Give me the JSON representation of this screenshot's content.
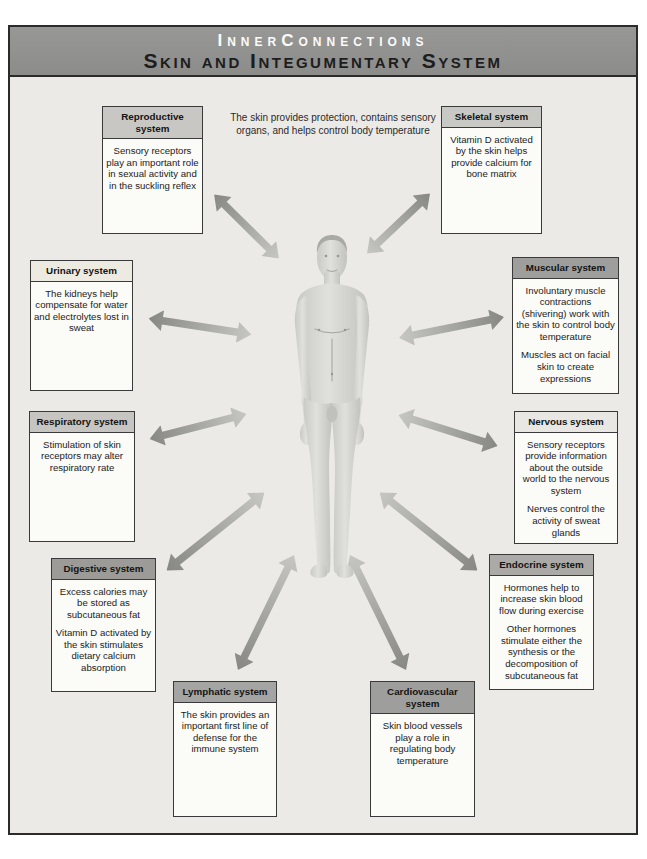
{
  "header": {
    "title": "InnerConnections",
    "subtitle": "Skin and Integumentary System"
  },
  "caption": "The skin provides protection, contains sensory organs, and helps control body temperature",
  "figure": {
    "icon": "male-anatomical-figure"
  },
  "colors": {
    "band_background": "#8f8f8d",
    "band_title": "#fbfbf9",
    "band_subtitle": "#1d1d1d",
    "content_background": "#eceae6",
    "box_background": "#fbfbf8",
    "box_border": "#3a3a3a",
    "arrow_dark": "#878783",
    "arrow_light": "#c6c6c2"
  },
  "systems": [
    {
      "name": "Reproductive system",
      "header_color": "#c8c7c3",
      "notes": [
        "Sensory receptors play an important role in sexual activity and in the suckling reflex"
      ]
    },
    {
      "name": "Skeletal system",
      "header_color": "#c8c9c4",
      "notes": [
        "Vitamin D activated by the skin helps provide calcium for bone matrix"
      ]
    },
    {
      "name": "Urinary system",
      "header_color": "#edebe1",
      "notes": [
        "The kidneys help compensate for water and electrolytes lost in sweat"
      ]
    },
    {
      "name": "Muscular system",
      "header_color": "#9e9e9c",
      "notes": [
        "Involuntary muscle contractions (shivering) work with the skin to control body temperature",
        "Muscles act on facial skin to create expressions"
      ]
    },
    {
      "name": "Respiratory system",
      "header_color": "#c7c5c1",
      "notes": [
        "Stimulation of skin receptors may alter respiratory rate"
      ]
    },
    {
      "name": "Nervous system",
      "header_color": "#e8e7e3",
      "notes": [
        "Sensory receptors provide information about the outside world to the nervous system",
        "Nerves control the activity of sweat glands"
      ]
    },
    {
      "name": "Digestive system",
      "header_color": "#9c9b97",
      "notes": [
        "Excess calories may be stored as subcutaneous fat",
        "Vitamin D activated by the skin stimulates dietary calcium absorption"
      ]
    },
    {
      "name": "Endocrine system",
      "header_color": "#abaaa6",
      "notes": [
        "Hormones help to increase skin blood flow during exercise",
        "Other hormones stimulate either the synthesis or the decomposition of subcutaneous fat"
      ]
    },
    {
      "name": "Lymphatic system",
      "header_color": "#a4a4a2",
      "notes": [
        "The skin provides an important first line of defense for the immune system"
      ]
    },
    {
      "name": "Cardiovascular system",
      "header_color": "#9e9e9c",
      "notes": [
        "Skin blood vessels play a role in regulating body temperature"
      ]
    }
  ]
}
